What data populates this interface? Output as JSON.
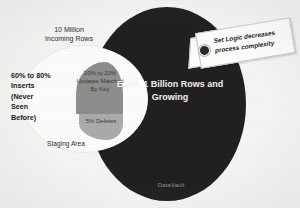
{
  "diagram": {
    "staging": {
      "name": "Staging Area",
      "incoming_label": "10 Million\nIncoming Rows",
      "inserts_label": "60% to 80%\nInserts\n(Never\nSeen\nBefore)",
      "updates_label": "10% to 20%\nUpdates\nMatched\nBy Key",
      "deletes_label": "5%\nDeletes"
    },
    "edw": {
      "label": "EDW:\n1 Billion Rows\nand Growing",
      "footer_label": "DataVault"
    },
    "callout": {
      "text": "Set Logic decreases\nprocess complexity"
    },
    "colors": {
      "background": "#f4f4f2",
      "edw_fill": "#211f1f",
      "staging_fill": "#fbfbfa",
      "updates_fill": "#8e8e8c",
      "deletes_fill": "#aaaaa8",
      "text_dark": "#231f20",
      "text_light": "#f2f2f0",
      "muted_text": "#8e8d8b"
    }
  },
  "chart_data": {
    "type": "pie",
    "categories": [
      "Inserts (Never Seen Before)",
      "Updates Matched By Key",
      "Deletes"
    ],
    "values": [
      70,
      15,
      5
    ],
    "value_labels": [
      "60% to 80%",
      "10% to 20%",
      "5%"
    ],
    "total_incoming_rows": "10 Million",
    "target_size": "1 Billion Rows and Growing",
    "legend": "none",
    "grid": false
  }
}
